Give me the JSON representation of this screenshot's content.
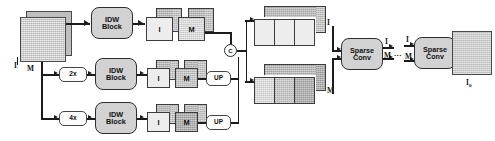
{
  "diagram": {
    "input": {
      "label_image": "I",
      "label_mask": "M"
    },
    "scales": [
      {
        "id": "scale-1x",
        "label": ""
      },
      {
        "id": "scale-2x",
        "label": "2x"
      },
      {
        "id": "scale-4x",
        "label": "4x"
      }
    ],
    "idw_block": {
      "line1": "IDW",
      "line2": "Block"
    },
    "branches": [
      {
        "id": "branch-full",
        "scale_label": "",
        "cube_image_label": "I",
        "cube_mask_label": "M",
        "has_upsample": false,
        "upsample_label": ""
      },
      {
        "id": "branch-2x",
        "scale_label": "2x",
        "cube_image_label": "I",
        "cube_mask_label": "M",
        "has_upsample": true,
        "upsample_label": "UP"
      },
      {
        "id": "branch-4x",
        "scale_label": "4x",
        "cube_image_label": "I",
        "cube_mask_label": "M",
        "has_upsample": true,
        "upsample_label": "UP"
      }
    ],
    "concat_node": {
      "label": "C",
      "name": "concatenation"
    },
    "concat_stacks": [
      {
        "id": "stack-image",
        "label": "I",
        "slabs": 3
      },
      {
        "id": "stack-mask",
        "label": "M",
        "slabs": 3
      }
    ],
    "sparse_conv": {
      "line1": "Sparse",
      "line2": "Conv"
    },
    "intermediate_signals": {
      "image": "I",
      "mask": "M",
      "ellipsis": "..."
    },
    "output": {
      "label": "I",
      "subscript": "o"
    },
    "colors": {
      "stroke": "#1c1c1c",
      "block_fill": "#d2d2d2",
      "small_box_fill": "#fbfbfb",
      "cube_front_light": "#ededed",
      "cube_front_mid": "#d8d8d8",
      "cube_front_dark": "#c2c2c2",
      "cube_top": "#b6b6b6",
      "background": "#ffffff"
    }
  }
}
